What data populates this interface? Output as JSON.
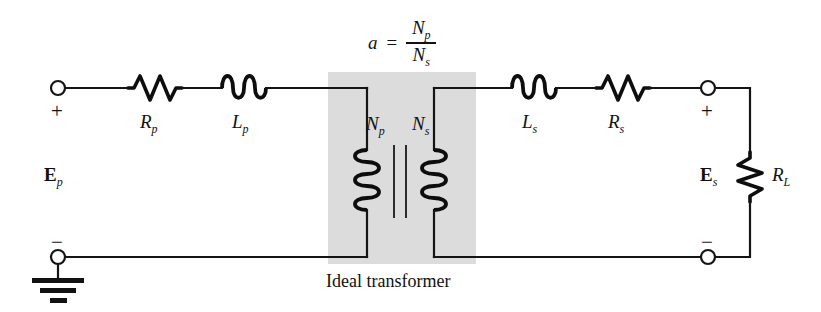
{
  "diagram": {
    "caption": "Ideal transformer",
    "turns_ratio": {
      "variable": "a",
      "equals": "=",
      "numerator_symbol": "N",
      "numerator_sub": "p",
      "denominator_symbol": "N",
      "denominator_sub": "s"
    },
    "labels": {
      "source_primary": "E",
      "source_primary_sub": "p",
      "source_secondary": "E",
      "source_secondary_sub": "s",
      "resistor_primary": "R",
      "resistor_primary_sub": "p",
      "inductor_primary": "L",
      "inductor_primary_sub": "p",
      "inductor_secondary": "L",
      "inductor_secondary_sub": "s",
      "resistor_secondary": "R",
      "resistor_secondary_sub": "s",
      "load_resistor": "R",
      "load_resistor_sub": "L",
      "primary_turns": "N",
      "primary_turns_sub": "p",
      "secondary_turns": "N",
      "secondary_turns_sub": "s"
    },
    "polarity": {
      "primary_plus": "+",
      "primary_minus": "−",
      "secondary_plus": "+",
      "secondary_minus": "−"
    },
    "colors": {
      "wire": "#141414",
      "component": "#0d0d0d",
      "shade_box": "#dcdcdc",
      "background": "#ffffff",
      "text": "#111111"
    },
    "components": [
      {
        "name": "primary-terminal-positive",
        "type": "terminal"
      },
      {
        "name": "resistor-rp",
        "type": "resistor"
      },
      {
        "name": "inductor-lp",
        "type": "inductor"
      },
      {
        "name": "transformer-primary-coil",
        "type": "coil"
      },
      {
        "name": "transformer-core",
        "type": "core"
      },
      {
        "name": "transformer-secondary-coil",
        "type": "coil"
      },
      {
        "name": "inductor-ls",
        "type": "inductor"
      },
      {
        "name": "resistor-rs",
        "type": "resistor"
      },
      {
        "name": "secondary-terminal-positive",
        "type": "terminal"
      },
      {
        "name": "load-resistor-rl",
        "type": "resistor"
      },
      {
        "name": "secondary-terminal-negative",
        "type": "terminal"
      },
      {
        "name": "primary-terminal-negative",
        "type": "terminal"
      },
      {
        "name": "ground-symbol",
        "type": "ground"
      }
    ]
  }
}
